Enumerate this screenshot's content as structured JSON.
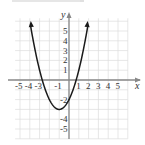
{
  "chart_data": {
    "type": "line",
    "title": "",
    "xlabel": "x",
    "ylabel": "y",
    "xlim": [
      -5.5,
      6
    ],
    "ylim": [
      -6,
      6.5
    ],
    "grid": true,
    "function": "y = x^2 + 2x - 2",
    "series": [
      {
        "name": "parabola",
        "x": [
          -3.9,
          -3.5,
          -3,
          -2.73,
          -2.5,
          -2,
          -1.5,
          -1,
          -0.5,
          0,
          0.5,
          0.73,
          1,
          1.5,
          1.9
        ],
        "y": [
          5.41,
          3.25,
          1,
          0,
          -0.75,
          -2,
          -2.75,
          -3,
          -2.75,
          -2,
          -0.75,
          0,
          1,
          3.25,
          5.41
        ]
      }
    ],
    "vertex": [
      -1,
      -3
    ],
    "x_intercepts": [
      -2.73,
      0.73
    ],
    "y_intercept": -2,
    "x_tick_labels": [
      "-5",
      "-4",
      "-3",
      "-1",
      "1",
      "2",
      "3",
      "4",
      "5"
    ],
    "y_tick_labels": [
      "5",
      "4",
      "3",
      "2",
      "1",
      "-2",
      "-4",
      "-5"
    ],
    "colors": {
      "curve": "#1a1a1a",
      "grid": "#dcdcdc",
      "axis": "#888888"
    }
  },
  "labels": {
    "x_axis": "x",
    "y_axis": "y"
  }
}
